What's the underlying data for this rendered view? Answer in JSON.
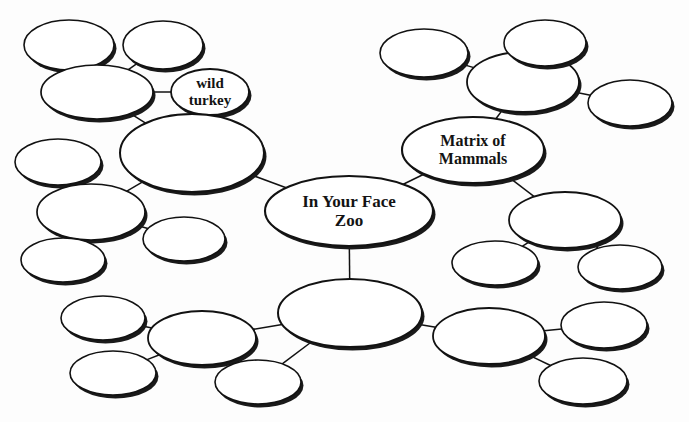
{
  "document": {
    "title": "In Your Face Zoo concept map",
    "type": "bubble-mind-map",
    "background_color": "#fdfdfd",
    "stroke_color": "#121212",
    "fill_color": "#ffffff",
    "shadow_color": "#1a1a1a"
  },
  "nodes": [
    {
      "id": "n-top-left-a",
      "label": "",
      "cx": 69,
      "cy": 45,
      "rx": 45,
      "ry": 25,
      "stroke_width": 1.6,
      "font_size": 0
    },
    {
      "id": "n-top-left-b",
      "label": "",
      "cx": 163,
      "cy": 45,
      "rx": 40,
      "ry": 24,
      "stroke_width": 1.6,
      "font_size": 0
    },
    {
      "id": "n-top-left-parent",
      "label": "",
      "cx": 97,
      "cy": 92,
      "rx": 56,
      "ry": 27,
      "stroke_width": 1.7,
      "font_size": 0
    },
    {
      "id": "n-wild-turkey",
      "label": "wild\nturkey",
      "cx": 210,
      "cy": 92,
      "rx": 39,
      "ry": 23,
      "stroke_width": 1.8,
      "font_size": 15
    },
    {
      "id": "n-upper-left-big",
      "label": "",
      "cx": 192,
      "cy": 153,
      "rx": 72,
      "ry": 39,
      "stroke_width": 2.0,
      "font_size": 0
    },
    {
      "id": "n-left-small-top",
      "label": "",
      "cx": 58,
      "cy": 162,
      "rx": 43,
      "ry": 23,
      "stroke_width": 1.6,
      "font_size": 0
    },
    {
      "id": "n-left-mid",
      "label": "",
      "cx": 91,
      "cy": 212,
      "rx": 54,
      "ry": 28,
      "stroke_width": 1.7,
      "font_size": 0
    },
    {
      "id": "n-left-small-bottom",
      "label": "",
      "cx": 63,
      "cy": 260,
      "rx": 42,
      "ry": 22,
      "stroke_width": 1.6,
      "font_size": 0
    },
    {
      "id": "n-left-right-small",
      "label": "",
      "cx": 184,
      "cy": 239,
      "rx": 41,
      "ry": 22,
      "stroke_width": 1.6,
      "font_size": 0
    },
    {
      "id": "n-center",
      "label": "In Your Face\nZoo",
      "cx": 349,
      "cy": 211,
      "rx": 84,
      "ry": 35,
      "stroke_width": 2.1,
      "font_size": 17
    },
    {
      "id": "n-matrix-of-mammals",
      "label": "Matrix of\nMammals",
      "cx": 473,
      "cy": 150,
      "rx": 71,
      "ry": 33,
      "stroke_width": 2.1,
      "font_size": 16
    },
    {
      "id": "n-right-upper-big",
      "label": "",
      "cx": 523,
      "cy": 82,
      "rx": 56,
      "ry": 30,
      "stroke_width": 1.8,
      "font_size": 0
    },
    {
      "id": "n-right-top-a",
      "label": "",
      "cx": 424,
      "cy": 53,
      "rx": 44,
      "ry": 24,
      "stroke_width": 1.6,
      "font_size": 0
    },
    {
      "id": "n-right-top-b",
      "label": "",
      "cx": 545,
      "cy": 43,
      "rx": 41,
      "ry": 23,
      "stroke_width": 1.6,
      "font_size": 0
    },
    {
      "id": "n-right-side",
      "label": "",
      "cx": 630,
      "cy": 103,
      "rx": 42,
      "ry": 23,
      "stroke_width": 1.6,
      "font_size": 0
    },
    {
      "id": "n-right-mid-big",
      "label": "",
      "cx": 565,
      "cy": 220,
      "rx": 56,
      "ry": 28,
      "stroke_width": 1.8,
      "font_size": 0
    },
    {
      "id": "n-right-mid-left",
      "label": "",
      "cx": 495,
      "cy": 263,
      "rx": 43,
      "ry": 22,
      "stroke_width": 1.6,
      "font_size": 0
    },
    {
      "id": "n-right-mid-right",
      "label": "",
      "cx": 620,
      "cy": 267,
      "rx": 42,
      "ry": 22,
      "stroke_width": 1.6,
      "font_size": 0
    },
    {
      "id": "n-bottom-center-big",
      "label": "",
      "cx": 350,
      "cy": 313,
      "rx": 72,
      "ry": 34,
      "stroke_width": 2.0,
      "font_size": 0
    },
    {
      "id": "n-bottom-left-mid",
      "label": "",
      "cx": 202,
      "cy": 338,
      "rx": 54,
      "ry": 27,
      "stroke_width": 1.8,
      "font_size": 0
    },
    {
      "id": "n-bottom-left-a",
      "label": "",
      "cx": 103,
      "cy": 318,
      "rx": 42,
      "ry": 22,
      "stroke_width": 1.6,
      "font_size": 0
    },
    {
      "id": "n-bottom-left-b",
      "label": "",
      "cx": 113,
      "cy": 373,
      "rx": 43,
      "ry": 22,
      "stroke_width": 1.6,
      "font_size": 0
    },
    {
      "id": "n-bottom-center-low",
      "label": "",
      "cx": 258,
      "cy": 382,
      "rx": 43,
      "ry": 22,
      "stroke_width": 1.6,
      "font_size": 0
    },
    {
      "id": "n-bottom-right-big",
      "label": "",
      "cx": 489,
      "cy": 336,
      "rx": 56,
      "ry": 28,
      "stroke_width": 1.8,
      "font_size": 0
    },
    {
      "id": "n-bottom-right-a",
      "label": "",
      "cx": 604,
      "cy": 325,
      "rx": 43,
      "ry": 23,
      "stroke_width": 1.6,
      "font_size": 0
    },
    {
      "id": "n-bottom-right-b",
      "label": "",
      "cx": 583,
      "cy": 381,
      "rx": 44,
      "ry": 23,
      "stroke_width": 1.6,
      "font_size": 0
    }
  ],
  "edges": [
    {
      "id": "e-1",
      "from": "n-top-left-a",
      "to": "n-top-left-parent"
    },
    {
      "id": "e-2",
      "from": "n-top-left-b",
      "to": "n-top-left-parent"
    },
    {
      "id": "e-3",
      "from": "n-top-left-parent",
      "to": "n-wild-turkey"
    },
    {
      "id": "e-4",
      "from": "n-top-left-parent",
      "to": "n-upper-left-big"
    },
    {
      "id": "e-5",
      "from": "n-upper-left-big",
      "to": "n-center"
    },
    {
      "id": "e-6",
      "from": "n-upper-left-big",
      "to": "n-left-mid"
    },
    {
      "id": "e-7",
      "from": "n-left-small-top",
      "to": "n-left-mid"
    },
    {
      "id": "e-8",
      "from": "n-left-mid",
      "to": "n-left-small-bottom"
    },
    {
      "id": "e-9",
      "from": "n-left-mid",
      "to": "n-left-right-small"
    },
    {
      "id": "e-10",
      "from": "n-center",
      "to": "n-matrix-of-mammals"
    },
    {
      "id": "e-11",
      "from": "n-matrix-of-mammals",
      "to": "n-right-upper-big"
    },
    {
      "id": "e-12",
      "from": "n-right-upper-big",
      "to": "n-right-top-b"
    },
    {
      "id": "e-13",
      "from": "n-right-upper-big",
      "to": "n-right-top-a"
    },
    {
      "id": "e-14",
      "from": "n-right-upper-big",
      "to": "n-right-side"
    },
    {
      "id": "e-15",
      "from": "n-matrix-of-mammals",
      "to": "n-right-mid-big"
    },
    {
      "id": "e-16",
      "from": "n-right-mid-big",
      "to": "n-right-mid-left"
    },
    {
      "id": "e-17",
      "from": "n-right-mid-big",
      "to": "n-right-mid-right"
    },
    {
      "id": "e-18",
      "from": "n-center",
      "to": "n-bottom-center-big"
    },
    {
      "id": "e-19",
      "from": "n-bottom-center-big",
      "to": "n-bottom-left-mid"
    },
    {
      "id": "e-20",
      "from": "n-bottom-left-mid",
      "to": "n-bottom-left-a"
    },
    {
      "id": "e-21",
      "from": "n-bottom-left-mid",
      "to": "n-bottom-left-b"
    },
    {
      "id": "e-22",
      "from": "n-bottom-center-big",
      "to": "n-bottom-center-low"
    },
    {
      "id": "e-23",
      "from": "n-bottom-center-big",
      "to": "n-bottom-right-big"
    },
    {
      "id": "e-24",
      "from": "n-bottom-right-big",
      "to": "n-bottom-right-a"
    },
    {
      "id": "e-25",
      "from": "n-bottom-right-big",
      "to": "n-bottom-right-b"
    }
  ]
}
